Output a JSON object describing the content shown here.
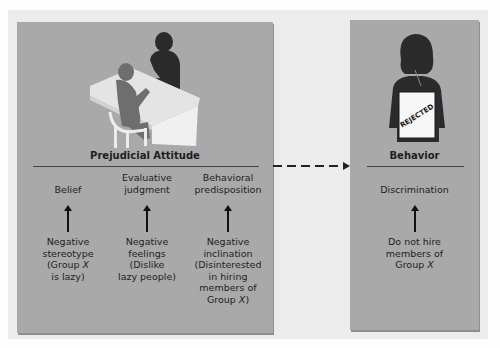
{
  "diagram": {
    "left_panel": {
      "title": "Prejudicial Attitude",
      "illustration": "interview-at-desk-icon",
      "columns": [
        {
          "label": [
            "",
            "Belief"
          ],
          "description": [
            "Negative",
            "stereotype",
            "(Group X",
            "is lazy)"
          ]
        },
        {
          "label": [
            "Evaluative",
            "judgment"
          ],
          "description": [
            "Negative",
            "feelings",
            "(Dislike",
            "lazy people)"
          ]
        },
        {
          "label": [
            "Behavioral",
            "predisposition"
          ],
          "description": [
            "Negative",
            "inclination",
            "(Disinterested",
            "in hiring",
            "members of",
            "Group X)"
          ]
        }
      ]
    },
    "connector": {
      "style": "dashed-arrow",
      "from": "Prejudicial Attitude",
      "to": "Behavior"
    },
    "right_panel": {
      "title": "Behavior",
      "illustration": "rejected-person-icon",
      "sign_text": "REJECTED",
      "columns": [
        {
          "label": [
            "Discrimination"
          ],
          "description": [
            "Do not hire",
            "members of",
            "Group X"
          ]
        }
      ]
    },
    "colors": {
      "panel": "#a9a9a9",
      "frame": "#ececec",
      "silhouette_dark": "#2b2b2b",
      "silhouette_mid": "#6e6e6e",
      "desk": "#e6e6e6"
    }
  }
}
